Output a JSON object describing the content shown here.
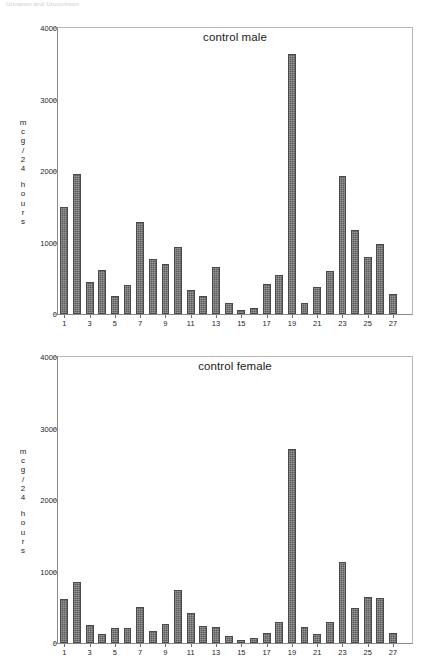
{
  "page": {
    "header_fragment": "Urination and Urocortison"
  },
  "charts": [
    {
      "id": "control-male",
      "title": "control male",
      "y_label_chars": [
        "m",
        "c",
        "g",
        "/",
        "2",
        "4",
        "",
        "h",
        "o",
        "u",
        "r",
        "s"
      ]
    },
    {
      "id": "control-female",
      "title": "control female",
      "y_label_chars": [
        "m",
        "c",
        "g",
        "/",
        "2",
        "4",
        "",
        "h",
        "o",
        "u",
        "r",
        "s"
      ]
    }
  ],
  "chart_data": [
    {
      "type": "bar",
      "id": "control-male",
      "title": "control male",
      "xlabel": "",
      "ylabel": "mcg/24 hours",
      "ylim": [
        0,
        4000
      ],
      "yticks": [
        0,
        1000,
        2000,
        3000,
        4000
      ],
      "ytick_labels": [
        "0",
        "1000",
        "2000",
        "3000",
        "4000"
      ],
      "xticks": [
        1,
        3,
        5,
        7,
        9,
        11,
        13,
        15,
        17,
        19,
        21,
        23,
        25,
        27
      ],
      "grid": false,
      "legend": false,
      "bar_color": "#5a5a5a",
      "categories": [
        1,
        2,
        3,
        4,
        5,
        6,
        7,
        8,
        9,
        10,
        11,
        12,
        13,
        14,
        15,
        16,
        17,
        18,
        19,
        20,
        21,
        22,
        23,
        24,
        25,
        26,
        27,
        28
      ],
      "values": [
        1490,
        1965,
        450,
        610,
        245,
        405,
        1285,
        775,
        700,
        940,
        330,
        250,
        660,
        160,
        60,
        85,
        415,
        545,
        3640,
        160,
        380,
        595,
        1930,
        1180,
        800,
        980,
        285,
        0
      ]
    },
    {
      "type": "bar",
      "id": "control-female",
      "title": "control female",
      "xlabel": "",
      "ylabel": "mcg/24 hours",
      "ylim": [
        0,
        4000
      ],
      "yticks": [
        0,
        1000,
        2000,
        3000,
        4000
      ],
      "ytick_labels": [
        "0",
        "1000",
        "2000",
        "3000",
        "4000"
      ],
      "xticks": [
        1,
        3,
        5,
        7,
        9,
        11,
        13,
        15,
        17,
        19,
        21,
        23,
        25,
        27
      ],
      "grid": false,
      "legend": false,
      "bar_color": "#5a5a5a",
      "categories": [
        1,
        2,
        3,
        4,
        5,
        6,
        7,
        8,
        9,
        10,
        11,
        12,
        13,
        14,
        15,
        16,
        17,
        18,
        19,
        20,
        21,
        22,
        23,
        24,
        25,
        26,
        27,
        28
      ],
      "values": [
        620,
        860,
        250,
        130,
        215,
        210,
        505,
        175,
        260,
        735,
        420,
        240,
        230,
        105,
        40,
        75,
        135,
        290,
        2720,
        230,
        125,
        300,
        1140,
        490,
        640,
        630,
        135,
        0
      ]
    }
  ]
}
